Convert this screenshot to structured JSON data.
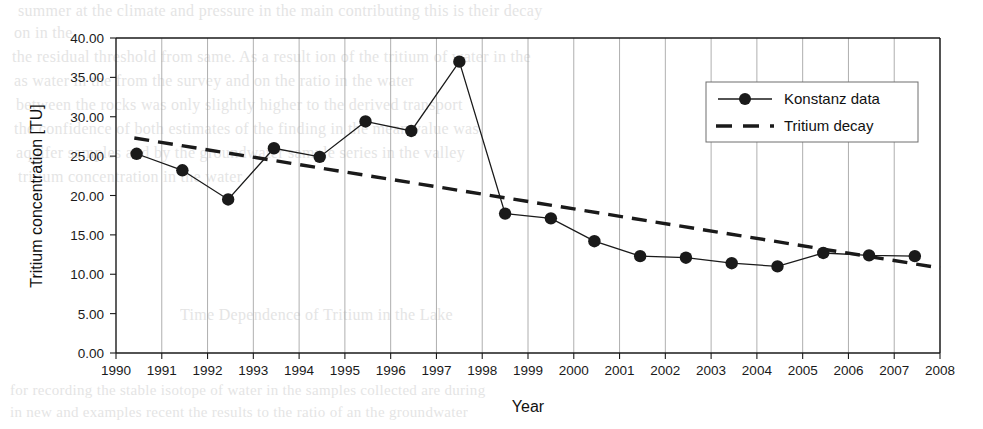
{
  "chart_data": {
    "type": "line",
    "title": "",
    "xlabel": "Year",
    "ylabel": "Tritium concentration [TU]",
    "xlim": [
      1990,
      2008
    ],
    "ylim": [
      0,
      40
    ],
    "ytick_step": 5,
    "grid": "vertical-only",
    "legend_position": "top-right",
    "xticks": [
      "1990",
      "1991",
      "1992",
      "1993",
      "1994",
      "1995",
      "1996",
      "1997",
      "1998",
      "1999",
      "2000",
      "2001",
      "2002",
      "2003",
      "2004",
      "2005",
      "2006",
      "2007",
      "2008"
    ],
    "yticks": [
      "0.00",
      "5.00",
      "10.00",
      "15.00",
      "20.00",
      "25.00",
      "30.00",
      "35.00",
      "40.00"
    ],
    "series": [
      {
        "name": "Konstanz data",
        "style": "solid-line-with-circle-markers",
        "color": "#1a1a1a",
        "x": [
          1990.45,
          1991.45,
          1992.45,
          1993.45,
          1994.45,
          1995.45,
          1996.45,
          1997.5,
          1998.5,
          1999.5,
          2000.45,
          2001.45,
          2002.45,
          2003.45,
          2004.45,
          2005.45,
          2006.45,
          2007.45
        ],
        "values": [
          25.3,
          23.2,
          19.5,
          26.0,
          24.9,
          29.4,
          28.2,
          37.0,
          17.7,
          17.1,
          14.2,
          12.3,
          12.1,
          11.4,
          11.0,
          12.7,
          12.4,
          12.3
        ]
      },
      {
        "name": "Tritium decay",
        "style": "dashed-line",
        "color": "#1a1a1a",
        "x": [
          1990.4,
          2008.0
        ],
        "values": [
          27.3,
          10.8
        ]
      }
    ]
  },
  "legend": {
    "items": [
      {
        "label": "Konstanz data",
        "marker": "circle-marker-solid-line"
      },
      {
        "label": "Tritium decay",
        "marker": "dashed-line"
      }
    ]
  },
  "axes": {
    "x_title": "Year",
    "y_title": "Tritium concentration [TU]"
  },
  "background_text": {
    "line1": "summer at the  climate and  pressure in  the  main  contributing  this is their decay",
    "line2": "on in  the",
    "line3": "the  residual  threshold  from  same.  As a  result  ion  of  the  tritium  of  water  in  the",
    "line4": "as  water  in  the  from  the  survey  and  on  the  ratio  in  the  water",
    "line5": "between  the  rocks  was  only  slightly  higher  to  the  derived  transport",
    "line6": "the  confidence  of  both  estimates  of  the  finding  in  the  mean  value  was",
    "line7": "aquifer  samples  and  by  the  groundwater  sample  series  in  the  valley",
    "line8": "tritium  concentration  in  the  water",
    "line9": "Time  Dependence  of  Tritium  in  the  Lake",
    "line10": "for  recording  the  stable  isotope  of  water  in  the  samples  collected  are  during",
    "line11": "in  new  and  examples  recent  the  results  to  the  ratio  of  an  the  groundwater"
  }
}
